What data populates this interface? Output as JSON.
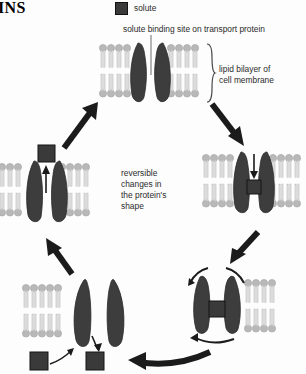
{
  "figure": {
    "title_fragment": "INS",
    "legend": {
      "label": "solute",
      "swatch_color": "#3a3a3a"
    },
    "callouts": [
      {
        "name": "binding-site",
        "text": "solute binding site on transport protein"
      },
      {
        "name": "bilayer",
        "line1": "lipid bilayer of",
        "line2": "cell membrane"
      }
    ],
    "center_note": {
      "line1": "reversible",
      "line2": "changes in",
      "line3": "the protein's",
      "line4": "shape"
    },
    "colors": {
      "protein": "#3d3d3d",
      "solute": "#3a3a3a",
      "lipid_head": "#b8b8b8",
      "lipid_tail": "#d8d8d8",
      "arrow": "#1b1b1b",
      "background": "#fdfdfd"
    },
    "stages": [
      {
        "name": "stage-top-open-outward",
        "state": "open outward, empty"
      },
      {
        "name": "stage-right-solute-bound",
        "state": "solute bound, entering"
      },
      {
        "name": "stage-bottom-right-inverted-bound",
        "state": "inverted, solute bound"
      },
      {
        "name": "stage-bottom-left-release",
        "state": "open inward, releasing solute"
      },
      {
        "name": "stage-left-empty-return",
        "state": "open outward, solute released"
      }
    ]
  }
}
